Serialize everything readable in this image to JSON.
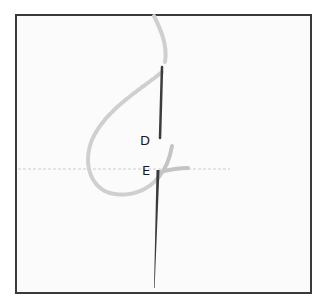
{
  "diagram": {
    "type": "embroidery-stitch-illustration",
    "labels": {
      "point_d": "D",
      "point_e": "E"
    },
    "colors": {
      "frame_border": "#3a3a3a",
      "fabric": "#fbfbfb",
      "thread": "#c9c9c9",
      "needle": "#3c3c3c",
      "label_text": "#1a1a1a"
    }
  }
}
